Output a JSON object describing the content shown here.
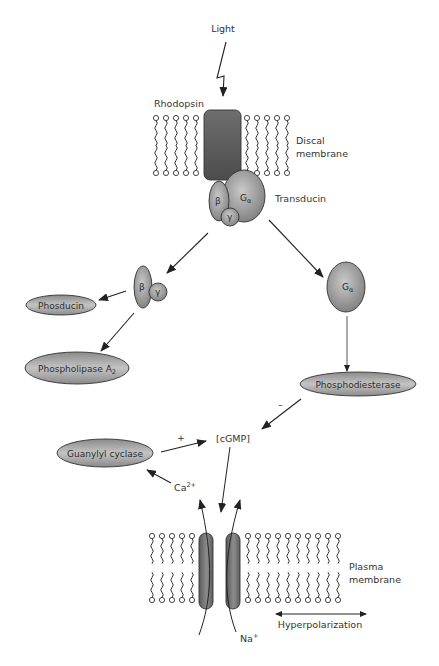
{
  "diagram": {
    "type": "signaling-pathway",
    "labels": {
      "light": "Light",
      "rhodopsin": "Rhodopsin",
      "discal_membrane_line1": "Discal",
      "discal_membrane_line2": "membrane",
      "transducin": "Transducin",
      "beta": "β",
      "gamma": "γ",
      "g_alpha": "G",
      "alpha_sub": "α",
      "phosducin": "Phosducin",
      "phospholipase": "Phospholipase A",
      "phospholipase_sub": "2",
      "phosphodiesterase": "Phosphodiesterase",
      "cgmp": "[cGMP]",
      "guanylyl_cyclase": "Guanylyl cyclase",
      "calcium": "Ca",
      "calcium_sup": "2+",
      "sodium": "Na",
      "sodium_sup": "+",
      "plus_sign": "+",
      "minus_sign": "–",
      "plasma_membrane_line1": "Plasma",
      "plasma_membrane_line2": "membrane",
      "hyperpolarization": "Hyperpolarization"
    },
    "nodes": [
      {
        "id": "light",
        "label": "Light"
      },
      {
        "id": "rhodopsin",
        "label": "Rhodopsin"
      },
      {
        "id": "transducin",
        "label": "Transducin",
        "subunits": [
          "β",
          "γ",
          "Gα"
        ]
      },
      {
        "id": "beta-gamma",
        "label": "βγ"
      },
      {
        "id": "g-alpha",
        "label": "Gα"
      },
      {
        "id": "phosducin",
        "label": "Phosducin"
      },
      {
        "id": "phospholipase-a2",
        "label": "Phospholipase A2"
      },
      {
        "id": "phosphodiesterase",
        "label": "Phosphodiesterase"
      },
      {
        "id": "cgmp",
        "label": "[cGMP]"
      },
      {
        "id": "guanylyl-cyclase",
        "label": "Guanylyl cyclase"
      },
      {
        "id": "cgmp-channel",
        "label": "cGMP-gated channel"
      }
    ],
    "edges": [
      {
        "from": "light",
        "to": "rhodopsin",
        "style": "lightning"
      },
      {
        "from": "transducin",
        "to": "beta-gamma"
      },
      {
        "from": "transducin",
        "to": "g-alpha"
      },
      {
        "from": "beta-gamma",
        "to": "phosducin"
      },
      {
        "from": "beta-gamma",
        "to": "phospholipase-a2"
      },
      {
        "from": "g-alpha",
        "to": "phosphodiesterase"
      },
      {
        "from": "phosphodiesterase",
        "to": "cgmp",
        "sign": "–"
      },
      {
        "from": "guanylyl-cyclase",
        "to": "cgmp",
        "sign": "+"
      },
      {
        "from": "cgmp",
        "to": "cgmp-channel"
      },
      {
        "from": "cgmp-channel",
        "to": "guanylyl-cyclase",
        "label": "Ca2+"
      },
      {
        "from": "outside",
        "to": "inside",
        "label": "Na+",
        "via": "cgmp-channel"
      }
    ],
    "colors": {
      "protein_dark": "#4a4a4a",
      "protein_light": "#bdbdbd",
      "line": "#222222",
      "text": "#333333"
    }
  }
}
